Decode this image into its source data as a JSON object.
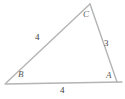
{
  "figure": {
    "type": "triangle-diagram",
    "background_color": "#ffffff",
    "stroke_color": "#b4b4b4",
    "label_color": "#4a4a4a",
    "vertices": {
      "A": {
        "label": "A",
        "x": 117,
        "y": 82
      },
      "B": {
        "label": "B",
        "x": 6,
        "y": 83
      },
      "C": {
        "label": "C",
        "x": 90,
        "y": 4
      }
    },
    "sides": {
      "bc": {
        "label": "4",
        "from": "B",
        "to": "C"
      },
      "ca": {
        "label": "3",
        "from": "C",
        "to": "A"
      },
      "ab": {
        "label": "4",
        "from": "A",
        "to": "B"
      }
    }
  }
}
